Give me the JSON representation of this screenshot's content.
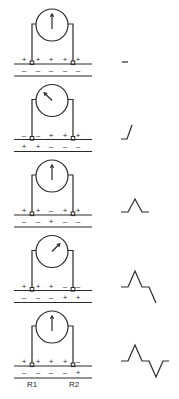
{
  "electrode_labels": [
    "R1",
    "R2"
  ],
  "panels": [
    {
      "stage": 1,
      "needle": "center",
      "outer_signs": [
        "+",
        "+",
        "+",
        "+",
        "+"
      ],
      "inner_signs": [
        "-",
        "-",
        "-",
        "-",
        "-"
      ],
      "waveform": "flat"
    },
    {
      "stage": 2,
      "needle": "left",
      "outer_signs": [
        "-",
        "-",
        "+",
        "+",
        "+"
      ],
      "inner_signs": [
        "+",
        "+",
        "-",
        "-",
        "-"
      ],
      "waveform": "upstroke"
    },
    {
      "stage": 3,
      "needle": "center",
      "outer_signs": [
        "+",
        "+",
        "-",
        "+",
        "+"
      ],
      "inner_signs": [
        "-",
        "-",
        "+",
        "-",
        "-"
      ],
      "waveform": "positive-peak"
    },
    {
      "stage": 4,
      "needle": "right",
      "outer_signs": [
        "+",
        "+",
        "+",
        "-",
        "-"
      ],
      "inner_signs": [
        "-",
        "-",
        "-",
        "+",
        "+"
      ],
      "waveform": "peak-then-downstroke"
    },
    {
      "stage": 5,
      "needle": "center",
      "outer_signs": [
        "+",
        "+",
        "+",
        "+",
        "-"
      ],
      "inner_signs": [
        "-",
        "-",
        "-",
        "-",
        "+"
      ],
      "waveform": "biphasic"
    }
  ]
}
